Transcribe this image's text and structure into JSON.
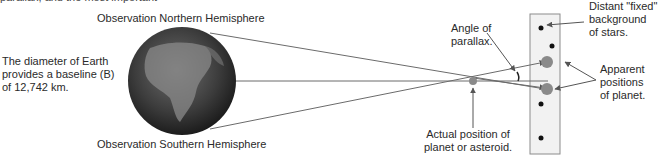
{
  "figure": {
    "cut_top_text": "parallax, and the most important",
    "labels": {
      "north": "Observation Northern Hemisphere",
      "south": "Observation Southern Hemisphere",
      "baseline": [
        "The diameter of Earth",
        "provides a baseline (B)",
        "of 12,742 km."
      ],
      "angle": [
        "Angle of",
        "parallax."
      ],
      "actual": [
        "Actual position of",
        "planet or asteroid."
      ],
      "stars": [
        "Distant \"fixed\"",
        "background",
        "of stars."
      ],
      "apparent": [
        "Apparent",
        "positions",
        "of planet."
      ]
    },
    "colors": {
      "line": "#6b6b6b",
      "planet": "#8a8a8a",
      "star": "#111111",
      "box_border": "#8c8c8c",
      "box_fill": "#f2f2f2"
    }
  }
}
